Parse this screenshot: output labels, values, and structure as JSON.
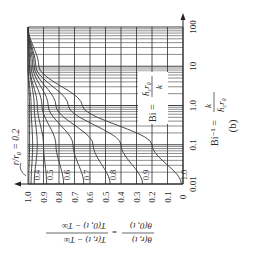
{
  "figure": {
    "panel_label": "(b)",
    "orientation": "rotated 90 degrees clockwise"
  },
  "chart_data": {
    "type": "line",
    "title": "",
    "panel": "(b)",
    "xlabel": "Bi^-1 = k / (h_c r0)",
    "ylabel": "θ(r,t)/θ(0,t) = (T(r,t) − T∞)/(T(0,t) − T∞)",
    "x_scale": "log",
    "xlim": [
      0.01,
      100
    ],
    "ylim": [
      0,
      1.0
    ],
    "x_ticks": [
      "0.01",
      "0.1",
      "1.0",
      "10",
      "100"
    ],
    "y_ticks": [
      "0",
      "0.1",
      "0.2",
      "0.3",
      "0.4",
      "0.5",
      "0.6",
      "0.7",
      "0.8",
      "0.9",
      "1.0"
    ],
    "grid": true,
    "annotations": [
      {
        "text": "r/r0 = 0.2",
        "target": "leftmost curve"
      },
      {
        "text": "Bi = h_c r0 / k",
        "position": "inside plot, upper region"
      }
    ],
    "series": [
      {
        "name": "r/r0 = 0.2",
        "label": "0.2",
        "x": [
          0.01,
          0.1,
          1.0,
          10,
          100
        ],
        "values": [
          0.995,
          0.99,
          0.99,
          1.0,
          1.0
        ]
      },
      {
        "name": "r/r0 = 0.3",
        "label": "0.3",
        "x": [
          0.01,
          0.1,
          1.0,
          10,
          100
        ],
        "values": [
          0.98,
          0.97,
          0.98,
          1.0,
          1.0
        ]
      },
      {
        "name": "r/r0 = 0.4",
        "label": "0.4",
        "x": [
          0.01,
          0.1,
          1.0,
          10,
          100
        ],
        "values": [
          0.96,
          0.94,
          0.96,
          0.99,
          1.0
        ]
      },
      {
        "name": "r/r0 = 0.5",
        "label": "0.5",
        "x": [
          0.01,
          0.1,
          1.0,
          10,
          100
        ],
        "values": [
          0.88,
          0.9,
          0.94,
          0.99,
          1.0
        ]
      },
      {
        "name": "r/r0 = 0.6",
        "label": "0.6",
        "x": [
          0.01,
          0.1,
          1.0,
          10,
          100
        ],
        "values": [
          0.77,
          0.82,
          0.91,
          0.98,
          1.0
        ]
      },
      {
        "name": "r/r0 = 0.7",
        "label": "0.7",
        "x": [
          0.01,
          0.1,
          1.0,
          10,
          100
        ],
        "values": [
          0.64,
          0.71,
          0.87,
          0.97,
          1.0
        ]
      },
      {
        "name": "r/r0 = 0.8",
        "label": "0.8",
        "x": [
          0.01,
          0.1,
          1.0,
          10,
          100
        ],
        "values": [
          0.47,
          0.58,
          0.82,
          0.96,
          1.0
        ]
      },
      {
        "name": "r/r0 = 0.9",
        "label": "0.9",
        "x": [
          0.01,
          0.1,
          1.0,
          10,
          100
        ],
        "values": [
          0.26,
          0.4,
          0.74,
          0.95,
          1.0
        ]
      },
      {
        "name": "r/r0 = 1.0",
        "label": "1.0",
        "x": [
          0.01,
          0.1,
          1.0,
          10,
          100
        ],
        "values": [
          0.01,
          0.2,
          0.65,
          0.93,
          1.0
        ]
      }
    ]
  },
  "labels": {
    "curve_param": "r/r₀ = 0.2",
    "bi_prefix": "Bi =",
    "bi_num": "h̄",
    "bi_num_sub": "c",
    "bi_num_tail": "r₀",
    "bi_den": "k",
    "biinv_prefix": "Bi⁻¹ =",
    "biinv_num": "k",
    "biinv_den": "h̄",
    "biinv_den_sub": "c",
    "biinv_den_tail": "r₀",
    "ylabel_left_num": "θ(r, t)",
    "ylabel_left_den": "θ(0, t)",
    "ylabel_eq": "=",
    "ylabel_right_num": "T(r, t) − T∞",
    "ylabel_right_den": "T(0, t) − T∞",
    "panel": "(b)"
  },
  "style": {
    "line_color": "#3a3a3a",
    "grid_color": "#2e2e2e",
    "background": "#ffffff"
  }
}
